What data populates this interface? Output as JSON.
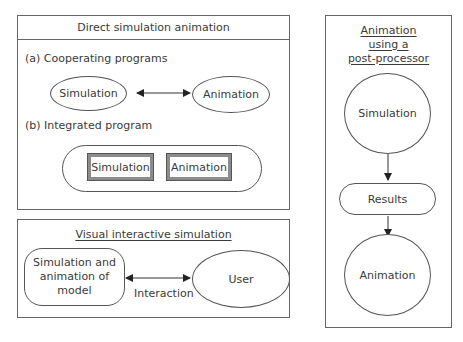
{
  "direct_panel": {
    "title": "Direct simulation animation",
    "section_a": {
      "label": "(a) Cooperating programs",
      "left_node": "Simulation",
      "right_node": "Animation"
    },
    "section_b": {
      "label": "(b) Integrated program",
      "left_box": "Simulation",
      "right_box": "Animation"
    }
  },
  "interactive_panel": {
    "title": "Visual interactive simulation",
    "left_node_lines": [
      "Simulation and",
      "animation of",
      "model"
    ],
    "right_node": "User",
    "edge_label": "Interaction"
  },
  "postprocessor_panel": {
    "title_lines": [
      "Animation",
      "using a",
      "post-processor"
    ],
    "top_node": "Simulation",
    "middle_node": "Results",
    "bottom_node": "Animation"
  },
  "colors": {
    "line": "#555555",
    "inner_box_fill": "#8c8c8c",
    "text": "#3a3a3a"
  }
}
